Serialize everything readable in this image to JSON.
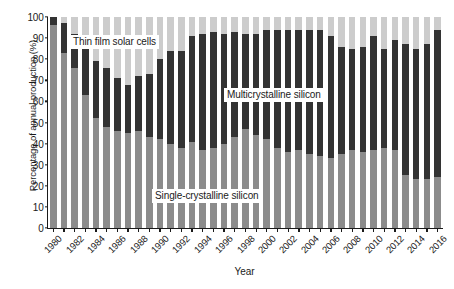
{
  "chart_data": {
    "type": "bar",
    "stacked": true,
    "stack_mode": "percent",
    "title": "",
    "xlabel": "Year",
    "ylabel": "Percentage of annual production (%)",
    "ylim": [
      0,
      100
    ],
    "yticks": [
      0,
      10,
      20,
      30,
      40,
      50,
      60,
      70,
      80,
      90,
      100
    ],
    "grid": false,
    "legend_position": "in-plot annotations",
    "categories": [
      "1980",
      "1981",
      "1982",
      "1983",
      "1984",
      "1985",
      "1986",
      "1987",
      "1988",
      "1989",
      "1990",
      "1991",
      "1992",
      "1993",
      "1994",
      "1995",
      "1996",
      "1997",
      "1998",
      "1999",
      "2000",
      "2001",
      "2002",
      "2003",
      "2004",
      "2005",
      "2006",
      "2007",
      "2008",
      "2009",
      "2010",
      "2011",
      "2012",
      "2013",
      "2014",
      "2015",
      "2016"
    ],
    "xtick_labels": [
      "1980",
      "1982",
      "1984",
      "1986",
      "1988",
      "1990",
      "1992",
      "1994",
      "1996",
      "1998",
      "2000",
      "2002",
      "2004",
      "2006",
      "2008",
      "2010",
      "2012",
      "2014",
      "2016"
    ],
    "series": [
      {
        "name": "Single-crystalline silicon",
        "color": "#8c8c8c",
        "values": [
          96,
          83,
          76,
          63,
          52,
          48,
          46,
          45,
          46,
          43,
          42,
          40,
          38,
          41,
          37,
          38,
          40,
          43,
          47,
          44,
          42,
          38,
          36,
          37,
          35,
          34,
          33,
          35,
          37,
          36,
          37,
          38,
          37,
          25,
          23,
          23,
          24
        ]
      },
      {
        "name": "Multicrystalline silicon",
        "color": "#333333",
        "values": [
          4,
          14,
          16,
          24,
          27,
          28,
          25,
          23,
          26,
          30,
          38,
          44,
          46,
          50,
          55,
          55,
          52,
          50,
          45,
          48,
          52,
          56,
          58,
          57,
          59,
          60,
          58,
          51,
          48,
          50,
          54,
          47,
          52,
          62,
          62,
          64,
          70
        ]
      },
      {
        "name": "Thin film solar cells",
        "color": "#cccccc",
        "values": [
          0,
          3,
          8,
          13,
          21,
          24,
          29,
          32,
          28,
          27,
          20,
          16,
          16,
          9,
          8,
          7,
          8,
          7,
          8,
          8,
          6,
          6,
          6,
          6,
          6,
          6,
          9,
          14,
          15,
          14,
          9,
          15,
          11,
          13,
          15,
          13,
          6
        ]
      }
    ]
  },
  "annotations": {
    "thin_film": "Thin film solar cells",
    "multicrystalline": "Multicrystalline silicon",
    "single_crystalline": "Single-crystalline silicon"
  }
}
